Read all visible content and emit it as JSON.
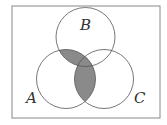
{
  "diagram": {
    "type": "venn",
    "sets": [
      {
        "label": "A",
        "cx": 66,
        "cy": 79,
        "r": 29.5
      },
      {
        "label": "B",
        "cx": 85.5,
        "cy": 37,
        "r": 29.5
      },
      {
        "label": "C",
        "cx": 104,
        "cy": 79,
        "r": 29.5
      }
    ],
    "shaded_region": "A ∩ (B ∪ C)",
    "colors": {
      "shade": "#8a8a8a",
      "stroke": "#555555",
      "border": "#888888"
    },
    "labels": {
      "a": "A",
      "b": "B",
      "c": "C"
    }
  }
}
